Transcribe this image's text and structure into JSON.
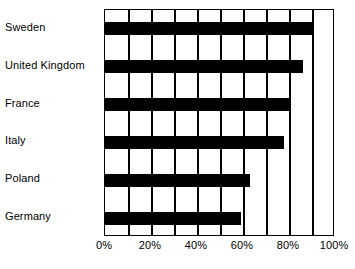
{
  "chart_data": {
    "type": "bar",
    "orientation": "horizontal",
    "title": "",
    "subtitle": "",
    "xlabel": "",
    "ylabel": "",
    "categories": [
      "Sweden",
      "United Kingdom",
      "France",
      "Italy",
      "Poland",
      "Germany"
    ],
    "values": [
      90,
      86,
      80,
      78,
      63,
      59
    ],
    "value_suffix": "%",
    "xlim": [
      0,
      100
    ],
    "x_tick_labels": [
      "0%",
      "20%",
      "40%",
      "60%",
      "80%",
      "100%"
    ],
    "x_tick_values": [
      0,
      20,
      40,
      60,
      80,
      100
    ],
    "gridline_values": [
      10,
      20,
      30,
      40,
      50,
      60,
      70,
      80,
      90
    ],
    "grid": true,
    "legend": "none",
    "bar_color": "#000000",
    "grid_color": "#000000",
    "background_color": "#ffffff",
    "text_color": "#000000"
  }
}
